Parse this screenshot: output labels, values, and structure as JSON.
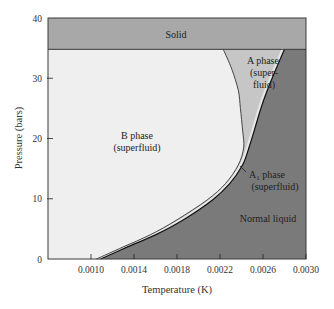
{
  "chart_data": {
    "type": "area",
    "title": "",
    "xlabel": "Temperature (K)",
    "ylabel": "Pressure (bars)",
    "xlim": [
      0.0006,
      0.003
    ],
    "ylim": [
      0,
      40
    ],
    "x_ticks": [
      "0.0010",
      "0.0014",
      "0.0018",
      "0.0022",
      "0.0026",
      "0.0030"
    ],
    "x_tick_values": [
      0.001,
      0.0014,
      0.0018,
      0.0022,
      0.0026,
      0.003
    ],
    "y_ticks": [
      "0",
      "10",
      "20",
      "30",
      "40"
    ],
    "y_tick_values": [
      0,
      10,
      20,
      30,
      40
    ],
    "grid": false,
    "solid_boundary_pressure": 34.8,
    "series": [
      {
        "name": "B/A phase boundary",
        "points": [
          [
            0.00105,
            0
          ],
          [
            0.0013,
            2
          ],
          [
            0.00155,
            4
          ],
          [
            0.0018,
            6.5
          ],
          [
            0.00208,
            9.8
          ],
          [
            0.00225,
            12.5
          ],
          [
            0.00237,
            15.6
          ],
          [
            0.00242,
            18.5
          ],
          [
            0.00241,
            21.4
          ],
          [
            0.00239,
            25
          ],
          [
            0.00237,
            28
          ],
          [
            0.00231,
            31.5
          ],
          [
            0.00223,
            34.8
          ]
        ]
      },
      {
        "name": "A phase / normal liquid boundary",
        "points": [
          [
            0.00109,
            0
          ],
          [
            0.00134,
            2
          ],
          [
            0.0016,
            4
          ],
          [
            0.00186,
            6.5
          ],
          [
            0.00213,
            9.8
          ],
          [
            0.00229,
            12.5
          ],
          [
            0.00241,
            15.6
          ],
          [
            0.00247,
            18.5
          ],
          [
            0.00252,
            21.4
          ],
          [
            0.00258,
            25
          ],
          [
            0.00264,
            28
          ],
          [
            0.00272,
            31.5
          ],
          [
            0.0028,
            34.8
          ]
        ]
      }
    ],
    "regions": [
      {
        "name": "Solid",
        "color": "#a8a8a8"
      },
      {
        "name": "B phase (superfluid)",
        "color": "#efefef"
      },
      {
        "name": "A phase (superfluid)",
        "color": "#c6c6c6"
      },
      {
        "name": "A1 phase (superfluid)",
        "color": "#e0e0e0"
      },
      {
        "name": "Normal liquid",
        "color": "#7a7a7a"
      }
    ],
    "annotations": [
      "Solid",
      "A phase (super-fluid)",
      "B phase (superfluid)",
      "A1 phase (superfluid)",
      "Normal liquid"
    ]
  },
  "labels": {
    "solid": "Solid",
    "a_phase_1": "A phase",
    "a_phase_2": "(super-",
    "a_phase_3": "fluid)",
    "b_phase_1": "B phase",
    "b_phase_2": "(superfluid)",
    "a1_phase_main": "A",
    "a1_phase_sub": "1",
    "a1_phase_rest": " phase",
    "a1_phase_2": "(superfluid)",
    "normal_liquid": "Normal liquid",
    "xlabel": "Temperature (K)",
    "ylabel": "Pressure (bars)"
  },
  "colors": {
    "solid": "#a8a8a8",
    "b_phase": "#efefef",
    "a_phase": "#c6c6c6",
    "normal_liquid": "#7a7a7a",
    "frame": "#3a3a3a"
  }
}
